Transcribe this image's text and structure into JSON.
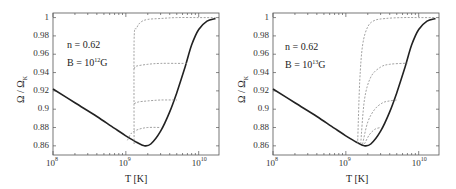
{
  "panels": [
    {
      "id": "left",
      "annotation": {
        "n_label": "n = 0.62",
        "b_prefix": "B = 10",
        "b_exp": "12",
        "b_suffix": "G"
      },
      "xlabel": "T [K]",
      "ylabel_main": "Ω / Ω",
      "ylabel_sub": "K",
      "yticks": [
        "1",
        "0.98",
        "0.96",
        "0.94",
        "0.92",
        "0.9",
        "0.88",
        "0.86"
      ],
      "xticks": [
        {
          "base": "10",
          "exp": "8"
        },
        {
          "base": "10",
          "exp": "9"
        },
        {
          "base": "10",
          "exp": "10"
        }
      ]
    },
    {
      "id": "right",
      "annotation": {
        "n_label": "n = 0.62",
        "b_prefix": "B = 10",
        "b_exp": "13",
        "b_suffix": "G"
      },
      "xlabel": "T [K]",
      "ylabel_main": "Ω / Ω",
      "ylabel_sub": "K",
      "yticks": [
        "1",
        "0.98",
        "0.96",
        "0.94",
        "0.92",
        "0.9",
        "0.88",
        "0.86"
      ],
      "xticks": [
        {
          "base": "10",
          "exp": "8"
        },
        {
          "base": "10",
          "exp": "9"
        },
        {
          "base": "10",
          "exp": "10"
        }
      ]
    }
  ],
  "colors": {
    "main_curve": "#222222",
    "dashed_curves": "#8a8a8a",
    "axis": "#555555"
  },
  "chart_data": [
    {
      "type": "line",
      "title": "n = 0.62, B = 10^12 G",
      "xlabel": "T [K]",
      "ylabel": "Ω / Ω_K",
      "xscale": "log",
      "xlim": [
        100000000.0,
        19000000000.0
      ],
      "ylim": [
        0.85,
        1.005
      ],
      "yticks": [
        0.86,
        0.88,
        0.9,
        0.92,
        0.94,
        0.96,
        0.98,
        1.0
      ],
      "xticks": [
        100000000.0,
        1000000000.0,
        10000000000.0
      ],
      "grid": false,
      "series": [
        {
          "name": "equilibrium (solid)",
          "style": "solid",
          "x": [
            100000000.0,
            200000000.0,
            400000000.0,
            700000000.0,
            1000000000.0,
            1400000000.0,
            1800000000.0,
            2200000000.0,
            3000000000.0,
            4000000000.0,
            5000000000.0,
            6500000000.0,
            8000000000.0,
            10000000000.0,
            13000000000.0,
            17000000000.0
          ],
          "y": [
            0.922,
            0.907,
            0.892,
            0.879,
            0.871,
            0.864,
            0.86,
            0.862,
            0.876,
            0.897,
            0.918,
            0.946,
            0.97,
            0.987,
            0.996,
            0.999
          ]
        },
        {
          "name": "track to 1.0 (dashed)",
          "style": "dashed",
          "x": [
            1300000000.0,
            1300000000.0,
            1400000000.0,
            1600000000.0,
            2000000000.0,
            3000000000.0,
            5000000000.0,
            10000000000.0,
            17000000000.0
          ],
          "y": [
            0.862,
            0.975,
            0.988,
            0.995,
            0.998,
            0.999,
            1.0,
            1.0,
            1.0
          ]
        },
        {
          "name": "track to 0.95 (dashed)",
          "style": "dashed",
          "x": [
            1300000000.0,
            1400000000.0,
            2000000000.0,
            3000000000.0,
            5000000000.0,
            7000000000.0
          ],
          "y": [
            0.944,
            0.947,
            0.949,
            0.95,
            0.95,
            0.95
          ]
        },
        {
          "name": "track to 0.91 (dashed)",
          "style": "dashed",
          "x": [
            1300000000.0,
            1500000000.0,
            2000000000.0,
            3000000000.0,
            5000000000.0
          ],
          "y": [
            0.906,
            0.908,
            0.909,
            0.91,
            0.91
          ]
        },
        {
          "name": "track to 0.88 (dashed)",
          "style": "dashed",
          "x": [
            1050000000.0,
            1200000000.0,
            1500000000.0,
            2000000000.0,
            3000000000.0
          ],
          "y": [
            0.866,
            0.874,
            0.878,
            0.88,
            0.88
          ]
        }
      ]
    },
    {
      "type": "line",
      "title": "n = 0.62, B = 10^13 G",
      "xlabel": "T [K]",
      "ylabel": "Ω / Ω_K",
      "xscale": "log",
      "xlim": [
        100000000.0,
        19000000000.0
      ],
      "ylim": [
        0.85,
        1.005
      ],
      "yticks": [
        0.86,
        0.88,
        0.9,
        0.92,
        0.94,
        0.96,
        0.98,
        1.0
      ],
      "xticks": [
        100000000.0,
        1000000000.0,
        10000000000.0
      ],
      "grid": false,
      "series": [
        {
          "name": "equilibrium (solid)",
          "style": "solid",
          "x": [
            100000000.0,
            200000000.0,
            400000000.0,
            700000000.0,
            1000000000.0,
            1400000000.0,
            1800000000.0,
            2200000000.0,
            3000000000.0,
            4000000000.0,
            5000000000.0,
            6500000000.0,
            8000000000.0,
            10000000000.0,
            13000000000.0,
            17000000000.0
          ],
          "y": [
            0.922,
            0.907,
            0.892,
            0.879,
            0.871,
            0.864,
            0.86,
            0.862,
            0.876,
            0.897,
            0.918,
            0.946,
            0.97,
            0.987,
            0.996,
            0.999
          ]
        },
        {
          "name": "track to 1.0 (dashed)",
          "style": "dashed",
          "x": [
            1450000000.0,
            1550000000.0,
            1700000000.0,
            2000000000.0,
            2500000000.0,
            3500000000.0,
            6000000000.0,
            10000000000.0,
            17000000000.0
          ],
          "y": [
            0.862,
            0.93,
            0.97,
            0.99,
            0.997,
            0.999,
            1.0,
            1.0,
            1.0
          ]
        },
        {
          "name": "track to 0.95 (dashed)",
          "style": "dashed",
          "x": [
            1600000000.0,
            1800000000.0,
            2200000000.0,
            3000000000.0,
            4000000000.0,
            6000000000.0,
            7000000000.0
          ],
          "y": [
            0.862,
            0.91,
            0.935,
            0.946,
            0.949,
            0.95,
            0.95
          ]
        },
        {
          "name": "track to 0.91 (dashed)",
          "style": "dashed",
          "x": [
            1700000000.0,
            2000000000.0,
            2500000000.0,
            3200000000.0,
            4000000000.0,
            5000000000.0
          ],
          "y": [
            0.862,
            0.886,
            0.9,
            0.907,
            0.909,
            0.91
          ]
        },
        {
          "name": "track to 0.88 (dashed)",
          "style": "dashed",
          "x": [
            1800000000.0,
            2100000000.0,
            2500000000.0,
            3000000000.0
          ],
          "y": [
            0.862,
            0.872,
            0.878,
            0.88
          ]
        }
      ]
    }
  ]
}
